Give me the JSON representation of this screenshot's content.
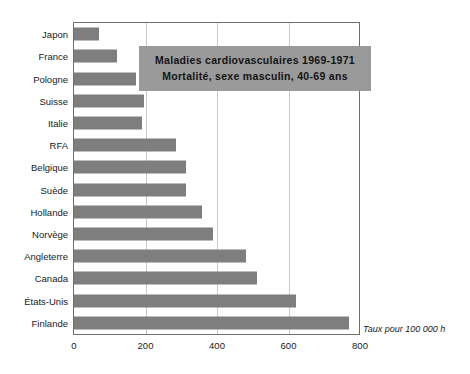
{
  "chart_data": {
    "type": "bar",
    "orientation": "horizontal",
    "title": "Maladies cardiovasculaires 1969-1971",
    "subtitle": "Mortalité, sexe masculin, 40-69 ans",
    "xlabel": "",
    "ylabel": "",
    "unit_note": "Taux pour 100 000 h",
    "xlim": [
      0,
      800
    ],
    "xticks": [
      0,
      200,
      400,
      600,
      800
    ],
    "xtick_labels": [
      "0",
      "200",
      "400",
      "600",
      "800"
    ],
    "grid": "vertical",
    "legend": "none",
    "bar_color": "#7e7e7e",
    "categories": [
      "Japon",
      "France",
      "Pologne",
      "Suisse",
      "Italie",
      "RFA",
      "Belgique",
      "Suède",
      "Hollande",
      "Norvège",
      "Angleterre",
      "Canada",
      "États-Unis",
      "Finlande"
    ],
    "values": [
      70,
      120,
      173,
      195,
      190,
      285,
      313,
      313,
      358,
      390,
      482,
      512,
      622,
      768
    ]
  }
}
